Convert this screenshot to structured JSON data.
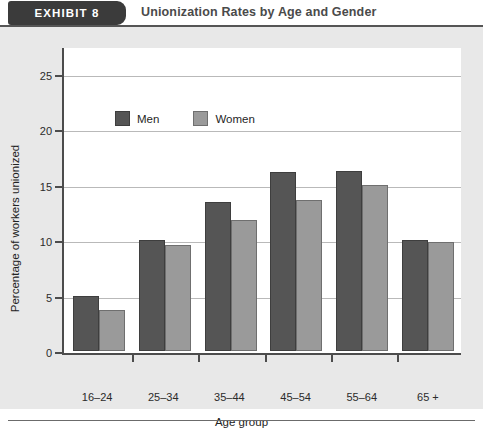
{
  "header": {
    "exhibit_tab": "EXHIBIT  8",
    "title": "Unionization Rates by Age and Gender"
  },
  "chart_data": {
    "type": "bar",
    "title": "Unionization Rates by Age and Gender",
    "xlabel": "Age group",
    "ylabel": "Percentage of workers unionized",
    "categories": [
      "16–24",
      "25–34",
      "35–44",
      "45–54",
      "55–64",
      "65 +"
    ],
    "series": [
      {
        "name": "Men",
        "color": "#555555",
        "values": [
          5.0,
          10.0,
          13.4,
          16.1,
          16.2,
          10.0
        ]
      },
      {
        "name": "Women",
        "color": "#9a9a9a",
        "values": [
          3.7,
          9.6,
          11.8,
          13.6,
          15.0,
          9.8
        ]
      }
    ],
    "ylim": [
      0,
      27.5
    ],
    "yticks": [
      0,
      5,
      10,
      15,
      20,
      25
    ],
    "ytick_labels": [
      "0",
      "5",
      "10",
      "15",
      "20",
      "25"
    ],
    "grid": true,
    "legend_position": "upper-left-inside"
  },
  "legend": {
    "men_label": "Men",
    "women_label": "Women"
  }
}
